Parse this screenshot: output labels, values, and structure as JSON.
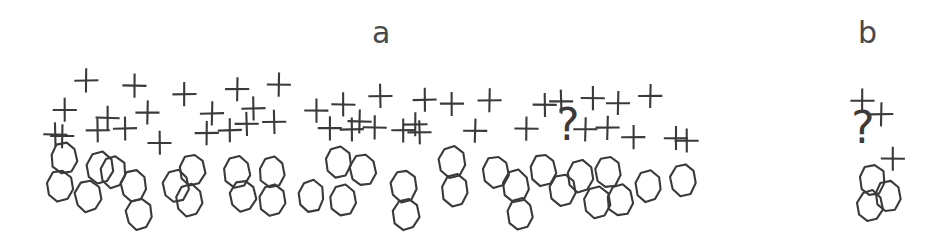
{
  "figure": {
    "background_color": "#ffffff",
    "ink_color": "#3a3a3a",
    "label_color": "#4a4a4a",
    "width": 937,
    "height": 244,
    "style": "hand-drawn line art, scanned diagram"
  },
  "panels": [
    {
      "id": "a",
      "label": "a",
      "label_x": 372,
      "label_y": 18,
      "label_font_size": 30,
      "bounds": {
        "x": 40,
        "y": 60,
        "width": 670,
        "height": 180
      },
      "counts": {
        "plus": 44,
        "circle": 33,
        "question": 1
      }
    },
    {
      "id": "b",
      "label": "b",
      "label_x": 858,
      "label_y": 18,
      "label_font_size": 30,
      "bounds": {
        "x": 845,
        "y": 88,
        "width": 75,
        "height": 140
      },
      "counts": {
        "plus": 3,
        "circle": 3,
        "question": 1
      }
    }
  ],
  "markers": {
    "plus_symbol": "+",
    "circle_symbol": "O",
    "question_symbol": "?",
    "plus_size": 22,
    "circle_width": 26,
    "circle_height": 32,
    "stroke_width": 2.1
  },
  "chart_data": {
    "type": "scatter",
    "title": "",
    "subtitle": "",
    "xlabel": "",
    "ylabel": "",
    "grid": false,
    "legend": false,
    "panels": [
      "a",
      "b"
    ],
    "series": [
      {
        "name": "plus",
        "panel": "a",
        "marker": "+",
        "points": [
          [
            87,
            80
          ],
          [
            134,
            86
          ],
          [
            185,
            94
          ],
          [
            237,
            89
          ],
          [
            279,
            84
          ],
          [
            65,
            110
          ],
          [
            108,
            118
          ],
          [
            148,
            112
          ],
          [
            212,
            114
          ],
          [
            253,
            108
          ],
          [
            316,
            110
          ],
          [
            344,
            104
          ],
          [
            381,
            96
          ],
          [
            425,
            100
          ],
          [
            452,
            104
          ],
          [
            490,
            100
          ],
          [
            62,
            136
          ],
          [
            98,
            130
          ],
          [
            125,
            129
          ],
          [
            159,
            143
          ],
          [
            207,
            133
          ],
          [
            246,
            124
          ],
          [
            330,
            128
          ],
          [
            352,
            130
          ],
          [
            375,
            128
          ],
          [
            404,
            131
          ],
          [
            420,
            133
          ],
          [
            475,
            130
          ],
          [
            527,
            128
          ],
          [
            561,
            102
          ],
          [
            593,
            98
          ],
          [
            618,
            103
          ],
          [
            650,
            96
          ],
          [
            586,
            130
          ],
          [
            633,
            137
          ],
          [
            687,
            140
          ],
          [
            55,
            134
          ],
          [
            230,
            130
          ],
          [
            274,
            122
          ],
          [
            360,
            122
          ],
          [
            415,
            125
          ],
          [
            545,
            105
          ],
          [
            608,
            128
          ],
          [
            676,
            138
          ]
        ]
      },
      {
        "name": "circle",
        "panel": "a",
        "marker": "O",
        "points": [
          [
            64,
            158
          ],
          [
            60,
            186
          ],
          [
            88,
            196
          ],
          [
            113,
            172
          ],
          [
            134,
            186
          ],
          [
            139,
            214
          ],
          [
            192,
            170
          ],
          [
            189,
            200
          ],
          [
            243,
            196
          ],
          [
            272,
            172
          ],
          [
            272,
            200
          ],
          [
            338,
            162
          ],
          [
            363,
            170
          ],
          [
            343,
            200
          ],
          [
            404,
            186
          ],
          [
            406,
            214
          ],
          [
            452,
            162
          ],
          [
            455,
            190
          ],
          [
            496,
            172
          ],
          [
            516,
            186
          ],
          [
            520,
            214
          ],
          [
            543,
            170
          ],
          [
            563,
            190
          ],
          [
            580,
            176
          ],
          [
            597,
            202
          ],
          [
            608,
            172
          ],
          [
            620,
            200
          ],
          [
            648,
            186
          ],
          [
            683,
            180
          ],
          [
            237,
            172
          ],
          [
            311,
            196
          ],
          [
            176,
            186
          ],
          [
            100,
            168
          ]
        ]
      },
      {
        "name": "question",
        "panel": "a",
        "marker": "?",
        "points": [
          [
            568,
            130
          ]
        ]
      },
      {
        "name": "plus",
        "panel": "b",
        "marker": "+",
        "points": [
          [
            862,
            101
          ],
          [
            881,
            114
          ],
          [
            893,
            158
          ]
        ]
      },
      {
        "name": "circle",
        "panel": "b",
        "marker": "O",
        "points": [
          [
            872,
            180
          ],
          [
            888,
            196
          ],
          [
            870,
            206
          ]
        ]
      },
      {
        "name": "question",
        "panel": "b",
        "marker": "?",
        "points": [
          [
            863,
            133
          ]
        ]
      }
    ]
  }
}
